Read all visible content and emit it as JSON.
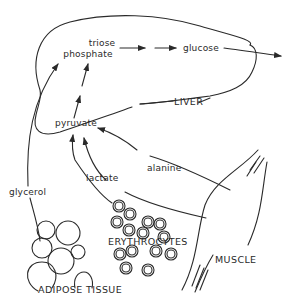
{
  "diagram": {
    "type": "metabolic-pathway",
    "colors": {
      "stroke": "#2a2a2a",
      "background": "#ffffff"
    },
    "organs": {
      "liver": "LIVER",
      "muscle": "MUSCLE",
      "erythrocytes": "ERYTHROCYTES",
      "adipose": "ADIPOSE TISSUE"
    },
    "metabolites": {
      "triose_line1": "triose",
      "triose_line2": "phosphate",
      "glucose": "glucose",
      "pyruvate": "pyruvate",
      "alanine": "alanine",
      "lactate": "lactate",
      "glycerol": "glycerol"
    },
    "edges": [
      {
        "from": "pyruvate",
        "to": "triose phosphate",
        "style": "dashed-arrow"
      },
      {
        "from": "triose phosphate",
        "to": "glucose",
        "style": "dashed-arrow"
      },
      {
        "from": "glucose",
        "to": "out",
        "style": "arrow"
      },
      {
        "from": "alanine",
        "to": "pyruvate",
        "source": "MUSCLE"
      },
      {
        "from": "lactate",
        "to": "pyruvate",
        "source": "ERYTHROCYTES"
      },
      {
        "from": "lactate",
        "to": "pyruvate",
        "source": "MUSCLE"
      },
      {
        "from": "glycerol",
        "to": "triose phosphate",
        "source": "ADIPOSE TISSUE"
      }
    ]
  }
}
